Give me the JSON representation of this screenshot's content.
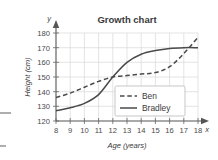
{
  "chart_data": {
    "type": "line",
    "title": "Growth chart",
    "xlabel": "Age (years)",
    "ylabel": "Height (cm)",
    "x_axis_letter": "x",
    "y_axis_letter": "y",
    "xlim": [
      8,
      18
    ],
    "ylim": [
      120,
      180
    ],
    "xticks": [
      8,
      9,
      10,
      11,
      12,
      13,
      14,
      15,
      16,
      17,
      18
    ],
    "yticks": [
      120,
      130,
      140,
      150,
      160,
      170,
      180
    ],
    "grid": true,
    "legend_position": "center-right",
    "x": [
      8,
      9,
      10,
      11,
      12,
      13,
      14,
      15,
      16,
      17,
      18
    ],
    "series": [
      {
        "name": "Ben",
        "style": "dashed",
        "color": "#4a4a4a",
        "values": [
          136,
          139,
          143,
          147,
          150,
          151,
          152,
          153,
          157,
          166,
          177
        ]
      },
      {
        "name": "Bradley",
        "style": "solid",
        "color": "#4a4a4a",
        "values": [
          127,
          129,
          132,
          138,
          150,
          160,
          165.5,
          168,
          169.5,
          170,
          170
        ]
      }
    ],
    "annotations": [
      "Curves intersect near age 12 at about 150 cm",
      "Curves intersect again near age 17 at about 170 cm"
    ]
  },
  "legend": {
    "entries": [
      {
        "label": "Ben",
        "style": "dashed"
      },
      {
        "label": "Bradley",
        "style": "solid"
      }
    ]
  },
  "colors": {
    "line": "#4a4a4a",
    "grid": "#d9d9d9",
    "axis": "#555555",
    "text": "#3a3a3a",
    "background": "#ffffff"
  }
}
